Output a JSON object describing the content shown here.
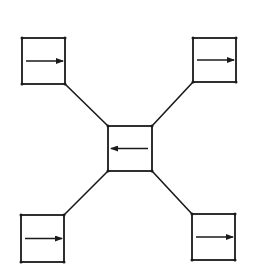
{
  "diagram": {
    "type": "star-topology",
    "colors": {
      "stroke": "#1a1a1a",
      "background": "#ffffff"
    },
    "nodes": [
      {
        "id": "top-left",
        "x": 22,
        "y": 38,
        "w": 43,
        "h": 46,
        "arrow": "right"
      },
      {
        "id": "top-right",
        "x": 193,
        "y": 38,
        "w": 43,
        "h": 44,
        "arrow": "right"
      },
      {
        "id": "center",
        "x": 108,
        "y": 126,
        "w": 44,
        "h": 45,
        "arrow": "left"
      },
      {
        "id": "bottom-left",
        "x": 21,
        "y": 215,
        "w": 43,
        "h": 47,
        "arrow": "right"
      },
      {
        "id": "bottom-right",
        "x": 192,
        "y": 214,
        "w": 43,
        "h": 46,
        "arrow": "right"
      }
    ],
    "edges": [
      {
        "from": "top-left",
        "to": "center",
        "x1": 65,
        "y1": 84,
        "x2": 108,
        "y2": 126
      },
      {
        "from": "top-right",
        "to": "center",
        "x1": 193,
        "y1": 82,
        "x2": 152,
        "y2": 126
      },
      {
        "from": "center",
        "to": "bottom-left",
        "x1": 108,
        "y1": 171,
        "x2": 64,
        "y2": 215
      },
      {
        "from": "center",
        "to": "bottom-right",
        "x1": 152,
        "y1": 171,
        "x2": 192,
        "y2": 214
      }
    ]
  }
}
